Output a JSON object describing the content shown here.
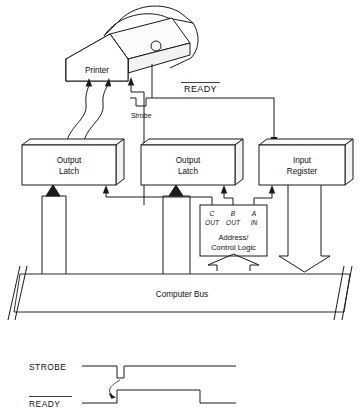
{
  "blocks": {
    "printer": {
      "label": "Printer"
    },
    "output_latch_left": {
      "line1": "Output",
      "line2": "Latch"
    },
    "output_latch_mid": {
      "line1": "Output",
      "line2": "Latch"
    },
    "input_register": {
      "line1": "Input",
      "line2": "Register"
    },
    "address_control_logic": {
      "line1": "Address/",
      "line2": "Control Logic"
    },
    "computer_bus": {
      "label": "Computer Bus"
    }
  },
  "ports": {
    "c": {
      "name": "C",
      "dir": "OUT"
    },
    "b": {
      "name": "B",
      "dir": "OUT"
    },
    "a": {
      "name": "A",
      "dir": "IN"
    }
  },
  "signals": {
    "ready": {
      "label": "READY",
      "active_low": true
    },
    "strobe": {
      "label": "Strobe",
      "glyph": "negative-pulse-icon"
    }
  },
  "timing": {
    "rows": [
      {
        "name": "STROBE",
        "overbar": false
      },
      {
        "name": "READY",
        "overbar": true
      }
    ],
    "chart_notes": "STROBE idles high, pulses low briefly, returns high; READY idles low, rises after the STROBE pulse, then falls."
  },
  "colors": {
    "ink": "#1a1a1a",
    "paper": "#ffffff",
    "shade": "#f2f2f2"
  }
}
